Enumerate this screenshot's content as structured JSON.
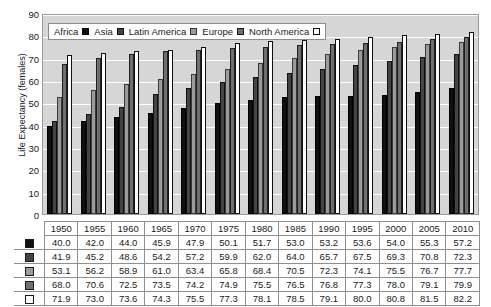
{
  "chart_data": {
    "type": "bar",
    "title": "",
    "xlabel": "",
    "ylabel": "Life Expectancy (females)",
    "ylim": [
      0,
      90
    ],
    "ytick_step": 10,
    "yticks": [
      90,
      80,
      70,
      60,
      50,
      40,
      30,
      20,
      10,
      0
    ],
    "grid": true,
    "legend_position": "top-left-inside",
    "categories": [
      "1950",
      "1955",
      "1960",
      "1965",
      "1970",
      "1975",
      "1980",
      "1985",
      "1990",
      "1995",
      "2000",
      "2005",
      "2010"
    ],
    "series": [
      {
        "name": "Africa",
        "swatch": "black",
        "color": "#101010",
        "values": [
          40.0,
          42.0,
          44.0,
          45.9,
          47.9,
          50.1,
          51.7,
          53.0,
          53.2,
          53.6,
          54.0,
          55.3,
          57.2
        ]
      },
      {
        "name": "Asia",
        "swatch": "dark-gray",
        "color": "#444444",
        "values": [
          41.9,
          45.2,
          48.6,
          54.2,
          57.2,
          59.9,
          62.0,
          64.0,
          65.7,
          67.5,
          69.3,
          70.8,
          72.3
        ]
      },
      {
        "name": "Latin America",
        "swatch": "light-gray",
        "color": "#9b9b9b",
        "values": [
          53.1,
          56.2,
          58.9,
          61.0,
          63.4,
          65.8,
          68.4,
          70.5,
          72.3,
          74.1,
          75.5,
          76.7,
          77.7
        ]
      },
      {
        "name": "Europe",
        "swatch": "mid-gray",
        "color": "#6f6f6f",
        "values": [
          68.0,
          70.6,
          72.5,
          73.5,
          74.2,
          74.9,
          75.5,
          76.5,
          76.8,
          77.3,
          78.0,
          79.1,
          79.9
        ]
      },
      {
        "name": "North America",
        "swatch": "white",
        "color": "#ffffff",
        "values": [
          71.9,
          73.0,
          73.6,
          74.3,
          75.5,
          77.3,
          78.1,
          78.5,
          79.1,
          80.0,
          80.8,
          81.5,
          82.2
        ]
      }
    ]
  },
  "table": {
    "header_corner": "",
    "years": [
      "1950",
      "1955",
      "1960",
      "1965",
      "1970",
      "1975",
      "1980",
      "1985",
      "1990",
      "1995",
      "2000",
      "2005",
      "2010"
    ],
    "rows": [
      {
        "series": "Africa",
        "values": [
          "40.0",
          "42.0",
          "44.0",
          "45.9",
          "47.9",
          "50.1",
          "51.7",
          "53.0",
          "53.2",
          "53.6",
          "54.0",
          "55.3",
          "57.2"
        ]
      },
      {
        "series": "Asia",
        "values": [
          "41.9",
          "45.2",
          "48.6",
          "54.2",
          "57.2",
          "59.9",
          "62.0",
          "64.0",
          "65.7",
          "67.5",
          "69.3",
          "70.8",
          "72.3"
        ]
      },
      {
        "series": "Latin America",
        "values": [
          "53.1",
          "56.2",
          "58.9",
          "61.0",
          "63.4",
          "65.8",
          "68.4",
          "70.5",
          "72.3",
          "74.1",
          "75.5",
          "76.7",
          "77.7"
        ]
      },
      {
        "series": "Europe",
        "values": [
          "68.0",
          "70.6",
          "72.5",
          "73.5",
          "74.2",
          "74.9",
          "75.5",
          "76.5",
          "76.8",
          "77.3",
          "78.0",
          "79.1",
          "79.9"
        ]
      },
      {
        "series": "North America",
        "values": [
          "71.9",
          "73.0",
          "73.6",
          "74.3",
          "75.5",
          "77.3",
          "78.1",
          "78.5",
          "79.1",
          "80.0",
          "80.8",
          "81.5",
          "82.2"
        ]
      }
    ]
  },
  "colors": {
    "plot_background": "#d6d6d6",
    "gridline": "#ffffff",
    "plot_border": "#9a9a9a",
    "text": "#1a1a1a",
    "table_border": "#8f8f8f"
  }
}
